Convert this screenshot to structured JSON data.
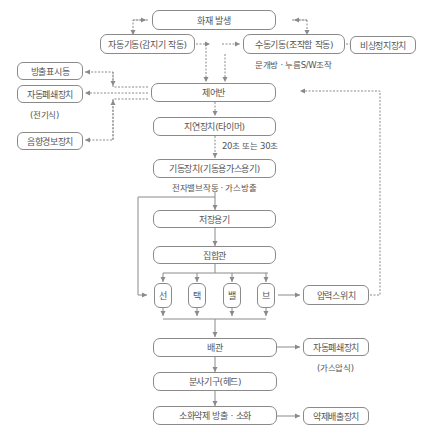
{
  "diagram": {
    "type": "flowchart",
    "nodes": {
      "fire": "화재 발생",
      "auto_start": "자동기동(감지기 작동)",
      "manual_start": "수동기동(조작함 작동)",
      "emergency_stop": "비상정지장치",
      "discharge_lamp": "방출표시등",
      "auto_closer_elec": "자동폐쇄장치",
      "control_panel": "제어반",
      "alarm": "음향경보장치",
      "delay": "지연장치(타이머)",
      "starter": "기동장치(기동용가스용기)",
      "storage": "저장용기",
      "manifold": "집합관",
      "valve_1": "선",
      "valve_2": "택",
      "valve_3": "밸",
      "valve_4": "브",
      "pressure_switch": "압력스위치",
      "piping": "배관",
      "auto_closer_gas": "자동폐쇄장치",
      "nozzle": "분사기구(헤드)",
      "discharge": "소화약제 방출 · 소화",
      "agent_exhaust": "약제배출장치"
    },
    "notes": {
      "manual_note": "문개방 · 누름S/W조작",
      "elec_note": "(전기식)",
      "delay_note": "20초 또는 30초",
      "starter_note": "전자밸브작동 · 가스방출",
      "gas_note": "(가스압식)"
    },
    "colors": {
      "line": "#8a8a8a",
      "text": "#555555"
    }
  }
}
